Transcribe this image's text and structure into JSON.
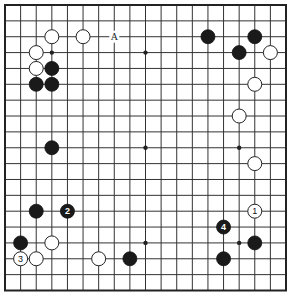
{
  "board": {
    "size": 19,
    "origin_x": 5,
    "origin_y": 5,
    "end_x": 286,
    "end_y": 290.5,
    "stone_radius": 7,
    "colors": {
      "background": "#ffffff",
      "lines": "#333333",
      "black_stone": "#1a1a1a",
      "white_stone": "#ffffff"
    },
    "star_points": [
      [
        3,
        3
      ],
      [
        9,
        3
      ],
      [
        15,
        3
      ],
      [
        3,
        9
      ],
      [
        9,
        9
      ],
      [
        15,
        9
      ],
      [
        3,
        15
      ],
      [
        9,
        15
      ],
      [
        15,
        15
      ]
    ],
    "stones": [
      {
        "color": "white",
        "col": 3,
        "row": 2,
        "label": ""
      },
      {
        "color": "white",
        "col": 5,
        "row": 2,
        "label": ""
      },
      {
        "color": "white",
        "col": 2,
        "row": 3,
        "label": ""
      },
      {
        "color": "white",
        "col": 2,
        "row": 4,
        "label": ""
      },
      {
        "color": "black",
        "col": 3,
        "row": 4,
        "label": ""
      },
      {
        "color": "black",
        "col": 2,
        "row": 5,
        "label": ""
      },
      {
        "color": "black",
        "col": 3,
        "row": 5,
        "label": ""
      },
      {
        "color": "black",
        "col": 13,
        "row": 2,
        "label": ""
      },
      {
        "color": "black",
        "col": 16,
        "row": 2,
        "label": ""
      },
      {
        "color": "black",
        "col": 15,
        "row": 3,
        "label": ""
      },
      {
        "color": "white",
        "col": 17,
        "row": 3,
        "label": ""
      },
      {
        "color": "white",
        "col": 16,
        "row": 5,
        "label": ""
      },
      {
        "color": "white",
        "col": 15,
        "row": 7,
        "label": ""
      },
      {
        "color": "black",
        "col": 3,
        "row": 9,
        "label": ""
      },
      {
        "color": "white",
        "col": 16,
        "row": 10,
        "label": ""
      },
      {
        "color": "black",
        "col": 2,
        "row": 13,
        "label": ""
      },
      {
        "color": "black",
        "col": 4,
        "row": 13,
        "label": "2"
      },
      {
        "color": "white",
        "col": 16,
        "row": 13,
        "label": "1"
      },
      {
        "color": "black",
        "col": 14,
        "row": 14,
        "label": "4"
      },
      {
        "color": "black",
        "col": 1,
        "row": 15,
        "label": ""
      },
      {
        "color": "white",
        "col": 3,
        "row": 15,
        "label": ""
      },
      {
        "color": "black",
        "col": 16,
        "row": 15,
        "label": ""
      },
      {
        "color": "white",
        "col": 1,
        "row": 16,
        "label": "3"
      },
      {
        "color": "white",
        "col": 2,
        "row": 16,
        "label": ""
      },
      {
        "color": "white",
        "col": 6,
        "row": 16,
        "label": ""
      },
      {
        "color": "black",
        "col": 8,
        "row": 16,
        "label": ""
      },
      {
        "color": "black",
        "col": 14,
        "row": 16,
        "label": ""
      }
    ],
    "markers": [
      {
        "col": 7,
        "row": 2,
        "label": "A"
      }
    ]
  }
}
